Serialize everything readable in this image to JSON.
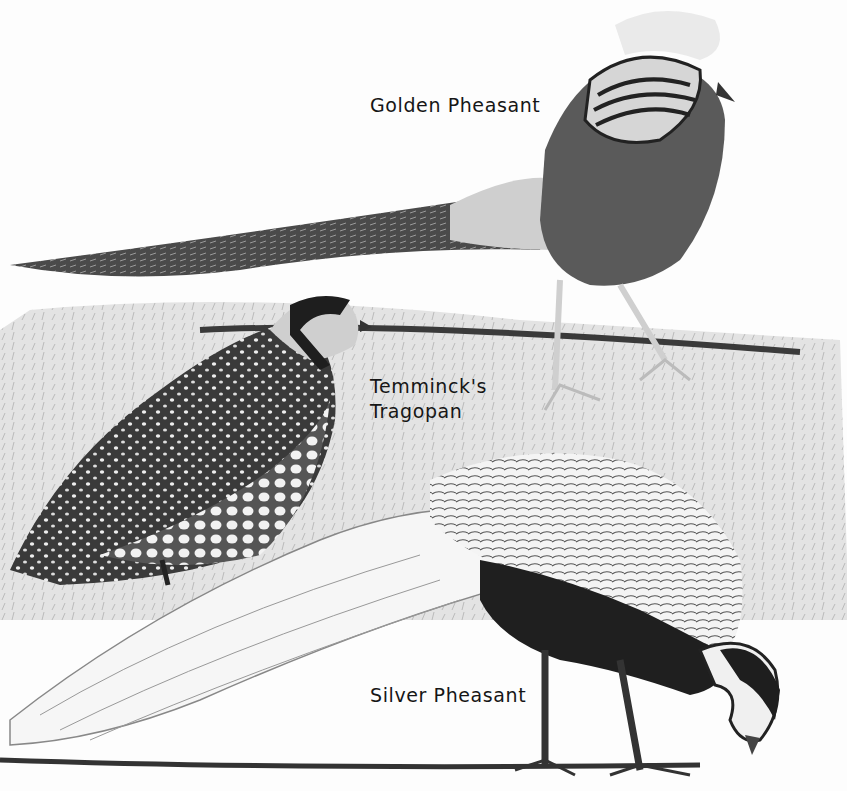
{
  "illustration": {
    "style": "black-and-white field guide plate",
    "labels": [
      {
        "id": "golden",
        "text": "Golden Pheasant"
      },
      {
        "id": "tragopan_line1",
        "text": "Temminck's"
      },
      {
        "id": "tragopan_line2",
        "text": "Tragopan"
      },
      {
        "id": "silver",
        "text": "Silver Pheasant"
      }
    ],
    "birds": [
      {
        "name": "Golden Pheasant",
        "position": "top, walking left with long tail"
      },
      {
        "name": "Temminck's Tragopan",
        "position": "middle left, spotted plumage"
      },
      {
        "name": "Silver Pheasant",
        "position": "bottom, feeding with head down"
      }
    ]
  }
}
